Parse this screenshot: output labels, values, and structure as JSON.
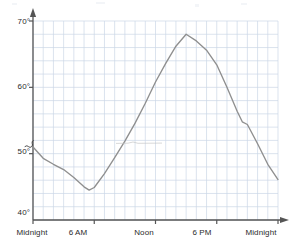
{
  "chart_data": {
    "type": "line",
    "title": "",
    "subtitle": "",
    "xlabel": "",
    "ylabel": "",
    "xlim": [
      0,
      24
    ],
    "ylim": [
      40,
      70
    ],
    "y_axis_break": true,
    "grid": true,
    "legend": "none",
    "line_color": "#8f8f8f",
    "grid_color": "#ccd7e6",
    "axis_color": "#555555",
    "y_ticks": [
      {
        "value": 40,
        "label": "40°"
      },
      {
        "value": 50,
        "label": "50°"
      },
      {
        "value": 60,
        "label": "60°"
      },
      {
        "value": 70,
        "label": "70°"
      }
    ],
    "y_gridline_step": 2,
    "x_ticks": [
      {
        "value": 0,
        "label": "Midnight"
      },
      {
        "value": 6,
        "label": "6 AM"
      },
      {
        "value": 12,
        "label": "Noon"
      },
      {
        "value": 18,
        "label": "6 PM"
      },
      {
        "value": 24,
        "label": "Midnight"
      }
    ],
    "x_gridline_step": 1,
    "series": [
      {
        "name": "Temperature",
        "x": [
          0,
          1,
          2,
          3,
          4,
          5,
          5.5,
          6,
          7,
          8,
          9,
          10,
          11,
          12,
          13,
          14,
          15,
          16,
          17,
          18,
          19,
          20,
          20.5,
          21,
          22,
          23,
          24
        ],
        "values": [
          51.0,
          49.3,
          48.4,
          47.6,
          46.4,
          45.0,
          44.5,
          44.9,
          47.0,
          49.4,
          51.9,
          54.6,
          57.6,
          60.8,
          63.6,
          66.2,
          68.0,
          67.0,
          65.6,
          63.4,
          60.0,
          56.4,
          54.8,
          54.4,
          51.5,
          48.4,
          46.1
        ]
      }
    ]
  }
}
